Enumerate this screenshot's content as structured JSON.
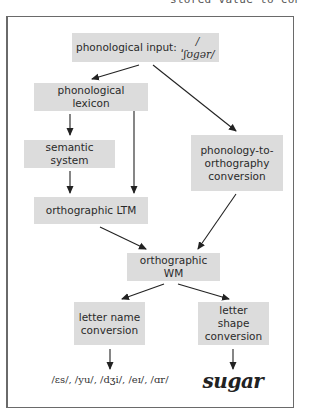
{
  "caption_fragment": "stored value to conver",
  "diagram": {
    "nodes": {
      "phonological_input": {
        "label": "phonological input: ",
        "ipa": "/ˈʃʊgər/"
      },
      "phonological_lexicon": {
        "label": "phonological lexicon"
      },
      "semantic_system": {
        "label": "semantic system"
      },
      "orthographic_ltm": {
        "label": "orthographic LTM"
      },
      "phonology_to_orthography": {
        "line1": "phonology-to-",
        "line2": "orthography",
        "line3": "conversion"
      },
      "orthographic_wm": {
        "label": "orthographic WM"
      },
      "letter_name_conversion": {
        "line1": "letter name",
        "line2": "conversion"
      },
      "letter_shape_conversion": {
        "line1": "letter shape",
        "line2": "conversion"
      }
    },
    "outputs": {
      "letter_names": "/ɛs/, /yu/, /dʒi/, /eɪ/, /ɑr/",
      "letter_shapes": "sugar"
    },
    "edges": [
      {
        "from": "phonological_input",
        "to": "phonological_lexicon"
      },
      {
        "from": "phonological_input",
        "to": "phonology_to_orthography"
      },
      {
        "from": "phonological_lexicon",
        "to": "semantic_system"
      },
      {
        "from": "phonological_lexicon",
        "to": "orthographic_ltm"
      },
      {
        "from": "semantic_system",
        "to": "orthographic_ltm"
      },
      {
        "from": "orthographic_ltm",
        "to": "orthographic_wm"
      },
      {
        "from": "phonology_to_orthography",
        "to": "orthographic_wm"
      },
      {
        "from": "orthographic_wm",
        "to": "letter_name_conversion"
      },
      {
        "from": "orthographic_wm",
        "to": "letter_shape_conversion"
      },
      {
        "from": "letter_name_conversion",
        "to": "letter_names"
      },
      {
        "from": "letter_shape_conversion",
        "to": "letter_shapes"
      }
    ],
    "colors": {
      "box_fill": "#dcdcdc",
      "frame": "#6a6a6a",
      "arrow": "#222222"
    }
  }
}
